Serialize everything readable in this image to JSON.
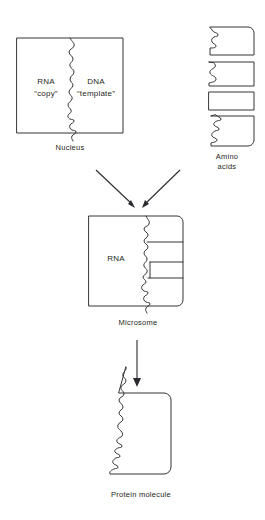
{
  "figure": {
    "background_color": "#ffffff",
    "line_color": "#35353a",
    "text_color": "#1f1f23"
  },
  "nucleus": {
    "caption": "Nucleus",
    "rna_label": "RNA",
    "rna_sublabel": "“copy”",
    "dna_label": "DNA",
    "dna_sublabel": "“template”"
  },
  "amino_acids": {
    "caption_line1": "Amino",
    "caption_line2": "acids",
    "count": 4,
    "items": [
      {
        "notch": "curl",
        "corner": "top-right-rounded"
      },
      {
        "notch": "zigzag",
        "corner": "square"
      },
      {
        "notch": "flat",
        "corner": "square"
      },
      {
        "notch": "coil",
        "corner": "bottom-right-rounded"
      }
    ]
  },
  "microsome": {
    "caption": "Microsome",
    "rna_label": "RNA",
    "attached_amino_acid_count": 4
  },
  "protein": {
    "caption": "Protein molecule"
  },
  "arrows": [
    {
      "name": "nucleus-to-microsome",
      "direction": "down-right"
    },
    {
      "name": "amino-acids-to-microsome",
      "direction": "down-left"
    },
    {
      "name": "microsome-to-protein",
      "direction": "down"
    }
  ]
}
